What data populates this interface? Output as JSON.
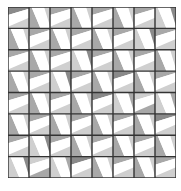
{
  "pattern": {
    "rows": 8,
    "cols": 8,
    "colors": {
      "background": "#ffffff",
      "band": "#ffffff",
      "grid_line": "#333333",
      "dark": "#8a8a8a",
      "mid": "#a8a8a8",
      "light": "#cfcfcf"
    },
    "shades": [
      [
        "dark",
        "light",
        "mid",
        "light",
        "mid",
        "light",
        "mid",
        "dark"
      ],
      [
        "light",
        "mid",
        "light",
        "mid",
        "light",
        "mid",
        "dark",
        "mid"
      ],
      [
        "mid",
        "light",
        "mid",
        "dark",
        "mid",
        "light",
        "mid",
        "light"
      ],
      [
        "light",
        "mid",
        "dark",
        "mid",
        "light",
        "dark",
        "light",
        "mid"
      ],
      [
        "mid",
        "light",
        "mid",
        "light",
        "dark",
        "mid",
        "light",
        "mid"
      ],
      [
        "light",
        "mid",
        "light",
        "mid",
        "light",
        "mid",
        "light",
        "dark"
      ],
      [
        "mid",
        "dark",
        "mid",
        "light",
        "mid",
        "light",
        "mid",
        "light"
      ],
      [
        "dark",
        "light",
        "mid",
        "dark",
        "light",
        "mid",
        "light",
        "mid"
      ]
    ]
  }
}
